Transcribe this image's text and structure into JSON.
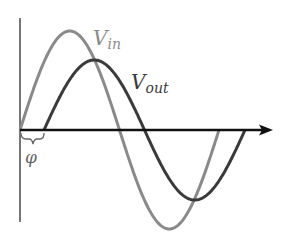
{
  "diagram": {
    "labels": {
      "vin_main": "V",
      "vin_sub": "in",
      "vout_main": "V",
      "vout_sub": "out",
      "phase": "φ"
    },
    "colors": {
      "vin": "#8a8a8a",
      "vout": "#3a3a3a",
      "axis": "#111111",
      "vertical_axis": "#555555",
      "label": "#666666"
    },
    "series": [
      {
        "name": "V_in",
        "amplitude": 99,
        "start_x": 20,
        "period": 199
      },
      {
        "name": "V_out",
        "amplitude": 70,
        "start_x": 44,
        "period": 201
      }
    ]
  }
}
